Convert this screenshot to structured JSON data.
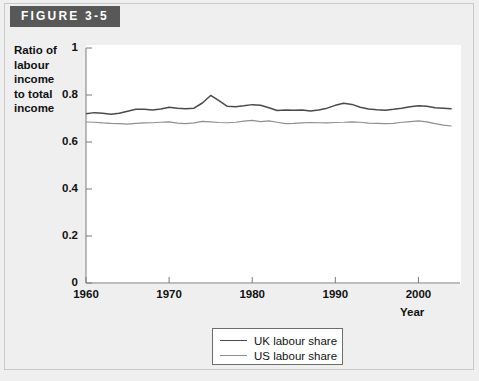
{
  "figure": {
    "banner_label": "FIGURE 3-5"
  },
  "axes": {
    "y_label_lines": [
      "Ratio of",
      "labour",
      "income",
      "to total",
      "income"
    ],
    "y_label_text": "Ratio of labour income to total income",
    "x_label": "Year",
    "y_ticks": [
      "1",
      "0.8",
      "0.6",
      "0.4",
      "0.2",
      "0"
    ],
    "x_ticks": [
      "1960",
      "1970",
      "1980",
      "1990",
      "2000"
    ]
  },
  "legend": {
    "position": "bottom-center",
    "items": [
      {
        "label": "UK labour share",
        "color": "#4a4a4a"
      },
      {
        "label": "US labour share",
        "color": "#8f8f8f"
      }
    ]
  },
  "colors": {
    "page_background": "#efefef",
    "plot_background": "#ffffff",
    "banner_background": "#585858",
    "banner_text": "#ffffff",
    "axis": "#7a7a7a",
    "uk_line": "#4a4a4a",
    "us_line": "#8f8f8f"
  },
  "chart_data": {
    "type": "line",
    "title": "FIGURE 3-5",
    "xlabel": "Year",
    "ylabel": "Ratio of labour income to total income",
    "xlim": [
      1960,
      2004
    ],
    "ylim": [
      0,
      1
    ],
    "yticks": [
      0,
      0.2,
      0.4,
      0.6,
      0.8,
      1
    ],
    "xticks": [
      1960,
      1970,
      1980,
      1990,
      2000
    ],
    "grid": false,
    "legend_position": "bottom-center",
    "x": [
      1960,
      1961,
      1962,
      1963,
      1964,
      1965,
      1966,
      1967,
      1968,
      1969,
      1970,
      1971,
      1972,
      1973,
      1974,
      1975,
      1976,
      1977,
      1978,
      1979,
      1980,
      1981,
      1982,
      1983,
      1984,
      1985,
      1986,
      1987,
      1988,
      1989,
      1990,
      1991,
      1992,
      1993,
      1994,
      1995,
      1996,
      1997,
      1998,
      1999,
      2000,
      2001,
      2002,
      2003,
      2004
    ],
    "series": [
      {
        "name": "UK labour share",
        "color": "#4a4a4a",
        "values": [
          0.72,
          0.725,
          0.722,
          0.718,
          0.722,
          0.731,
          0.739,
          0.739,
          0.736,
          0.74,
          0.748,
          0.744,
          0.742,
          0.744,
          0.766,
          0.798,
          0.776,
          0.752,
          0.75,
          0.754,
          0.759,
          0.756,
          0.746,
          0.734,
          0.736,
          0.735,
          0.736,
          0.732,
          0.736,
          0.744,
          0.756,
          0.765,
          0.76,
          0.748,
          0.74,
          0.737,
          0.735,
          0.739,
          0.744,
          0.75,
          0.754,
          0.752,
          0.746,
          0.744,
          0.742
        ]
      },
      {
        "name": "US labour share",
        "color": "#8f8f8f",
        "values": [
          0.685,
          0.684,
          0.681,
          0.679,
          0.678,
          0.676,
          0.679,
          0.681,
          0.682,
          0.684,
          0.686,
          0.68,
          0.678,
          0.681,
          0.688,
          0.686,
          0.683,
          0.682,
          0.684,
          0.689,
          0.692,
          0.687,
          0.69,
          0.684,
          0.678,
          0.679,
          0.681,
          0.683,
          0.682,
          0.681,
          0.683,
          0.684,
          0.686,
          0.684,
          0.68,
          0.679,
          0.678,
          0.679,
          0.684,
          0.687,
          0.69,
          0.686,
          0.678,
          0.672,
          0.668
        ]
      }
    ]
  }
}
